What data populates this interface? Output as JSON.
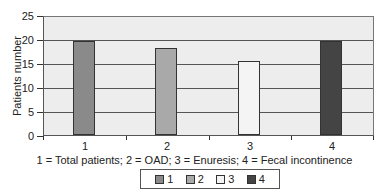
{
  "chart_data": {
    "type": "bar",
    "title": "",
    "xlabel": "1 = Total patients; 2 = OAD; 3 = Enuresis; 4 = Fecal incontinence",
    "ylabel": "Patients number",
    "categories": [
      "1",
      "2",
      "3",
      "4"
    ],
    "values": [
      20,
      18.4,
      15.6,
      20
    ],
    "colors": [
      "#8a8a8a",
      "#a9a9a9",
      "#f4f4f4",
      "#444444"
    ],
    "ylim": [
      0,
      25
    ],
    "yticks": [
      "0",
      "5",
      "10",
      "15",
      "20",
      "25"
    ],
    "grid": true,
    "legend": {
      "position": "bottom",
      "entries": [
        "1",
        "2",
        "3",
        "4"
      ]
    }
  }
}
